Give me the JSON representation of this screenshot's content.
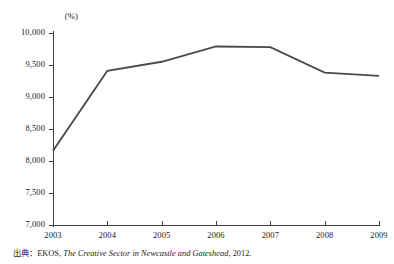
{
  "chart_data": {
    "type": "line",
    "title": "",
    "subtitle": "",
    "xlabel": "",
    "ylabel": "",
    "unit_label": "(%)",
    "categories": [
      "2003",
      "2004",
      "2005",
      "2006",
      "2007",
      "2008",
      "2009"
    ],
    "x": [
      2003,
      2004,
      2005,
      2006,
      2007,
      2008,
      2009
    ],
    "values": [
      8160,
      9410,
      9550,
      9790,
      9780,
      9380,
      9330
    ],
    "series": [
      {
        "name": "",
        "values": [
          8160,
          9410,
          9550,
          9790,
          9780,
          9380,
          9330
        ]
      }
    ],
    "ylim": [
      7000,
      10000
    ],
    "xlim": [
      2003,
      2009
    ],
    "yticks": [
      7000,
      7500,
      8000,
      8500,
      9000,
      9500,
      10000
    ],
    "ytick_labels": [
      "7,000",
      "7,500",
      "8,000",
      "8,500",
      "9,000",
      "9,500",
      "10,000"
    ],
    "xtick_labels": [
      "2003",
      "2004",
      "2005",
      "2006",
      "2007",
      "2008",
      "2009"
    ],
    "grid": false,
    "legend": false,
    "legend_position": "none",
    "line_color": "#4a4a4a",
    "axis_color": "#3d3d3d",
    "background_color": "#ffffff",
    "markers": false
  },
  "notes": {
    "source_prefix": "出典：EKOS, ",
    "source_title": "The Creative Sector in Newcastle and Gateshead",
    "source_suffix": ", 2012."
  }
}
